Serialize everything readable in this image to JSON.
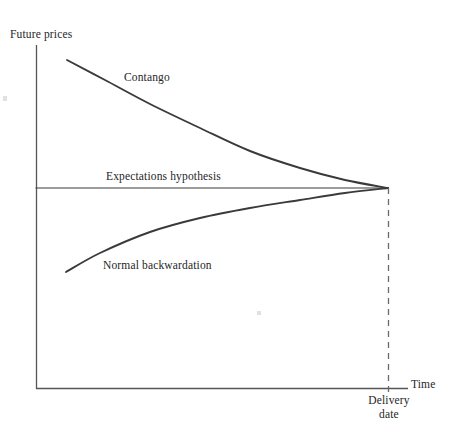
{
  "figure": {
    "type": "line-diagram",
    "background_color": "#ffffff",
    "stroke_color": "#3a3a3a",
    "axis_color": "#555555"
  },
  "axes": {
    "y_label": "Future prices",
    "x_label": "Time",
    "origin": {
      "x": 36,
      "y": 388
    },
    "y_top": 45,
    "x_right": 408
  },
  "annotations": {
    "contango_label": "Contango",
    "expectations_label": "Expectations hypothesis",
    "backwardation_label": "Normal backwardation",
    "delivery_line1": "Delivery",
    "delivery_line2": "date"
  },
  "chart_data": {
    "type": "line",
    "title": "",
    "xlabel": "Time",
    "ylabel": "Future prices",
    "xlim": [
      36,
      408
    ],
    "ylim": [
      388,
      45
    ],
    "grid": false,
    "legend_position": "inline-annotations",
    "convergence_point": {
      "x": 388,
      "y": 188
    },
    "delivery_date_x": 388,
    "series": [
      {
        "name": "Contango",
        "description": "Futures price above expected spot, declining convexly to converge at delivery",
        "label_position": {
          "x": 124,
          "y": 78
        },
        "points": [
          {
            "x": 67,
            "y": 60
          },
          {
            "x": 105,
            "y": 80
          },
          {
            "x": 150,
            "y": 104
          },
          {
            "x": 200,
            "y": 128
          },
          {
            "x": 250,
            "y": 151
          },
          {
            "x": 300,
            "y": 168
          },
          {
            "x": 345,
            "y": 180
          },
          {
            "x": 388,
            "y": 188
          }
        ]
      },
      {
        "name": "Expectations hypothesis",
        "description": "Flat line: futures price equals expected future spot price",
        "label_position": {
          "x": 106,
          "y": 177
        },
        "points": [
          {
            "x": 36,
            "y": 188
          },
          {
            "x": 388,
            "y": 188
          }
        ]
      },
      {
        "name": "Normal backwardation",
        "description": "Futures price below expected spot, rising concavely to converge at delivery",
        "label_position": {
          "x": 103,
          "y": 266
        },
        "points": [
          {
            "x": 66,
            "y": 272
          },
          {
            "x": 100,
            "y": 253
          },
          {
            "x": 150,
            "y": 232
          },
          {
            "x": 200,
            "y": 218
          },
          {
            "x": 250,
            "y": 208
          },
          {
            "x": 300,
            "y": 200
          },
          {
            "x": 345,
            "y": 193
          },
          {
            "x": 388,
            "y": 188
          }
        ]
      }
    ],
    "reference_lines": [
      {
        "name": "delivery-date-dashed",
        "orientation": "vertical",
        "x": 388,
        "y_from": 188,
        "y_to": 396,
        "style": "dashed"
      }
    ]
  }
}
